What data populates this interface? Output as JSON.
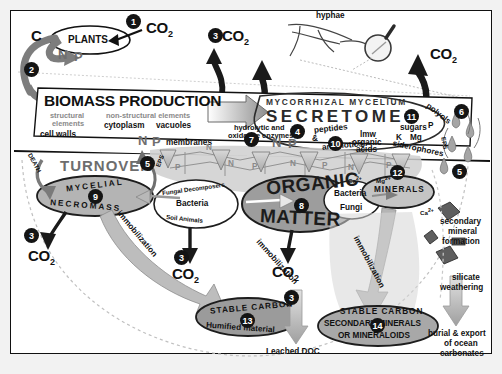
{
  "diagram": {
    "background_color": "#f2f2f2",
    "panel_color": "#ffffff"
  },
  "top": {
    "plants": "PLANTS",
    "c_label": "C",
    "n_label": "N",
    "p_label": "P",
    "co2_1": "CO",
    "co2_sub": "2",
    "hyphae": "hyphae"
  },
  "biomass": {
    "title": "BIOMASS PRODUCTION",
    "structural": "structural",
    "elements": "elements",
    "cell_walls": "cell walls",
    "non_structural": "non-structural elements",
    "cytoplasm": "cytoplasm",
    "vacuoles": "vacuoles",
    "membranes": "membranes",
    "n": "N",
    "p": "P"
  },
  "secretome": {
    "header": "MYCORRHIZAL MYCELIUM",
    "title": "SECRETOME",
    "enzymes_1": "hydrolytic and",
    "enzymes_2": "oxidative enzymes",
    "peptides": "peptides",
    "amp": "&",
    "antibiotics": "antibiotics",
    "lmw": "lmw",
    "organic": "organic",
    "acids": "acids",
    "sugars": "sugars",
    "polyols": "polyols",
    "siderophores": "siderophores",
    "p": "P",
    "k": "K",
    "mg": "Mg",
    "n": "N",
    "eps": "EPS"
  },
  "turnover": {
    "label": "TURNOVER",
    "death": "DEATH",
    "mycelial": "MYCELIAL",
    "necromass": "NECROMASS"
  },
  "decomposers": {
    "fungal": "Fungal Decomposers",
    "bacteria": "Bacteria",
    "soil_animals": "Soil Animals"
  },
  "organic_matter": {
    "line1": "ORGANIC",
    "line2": "MATTER"
  },
  "minerals_group": {
    "bacteria": "Bacteria",
    "fungi": "Fungi",
    "minerals": "MINERALS",
    "ca": "Ca",
    "mg": "Mg"
  },
  "stable_carbon_left": {
    "line1": "STABLE   CARBON",
    "line2": "Humified  material"
  },
  "stable_carbon_right": {
    "line1": "STABLE    CARBON",
    "line2": "SECONDARY        MINERALS",
    "line3": "OR      MINERALOIDS"
  },
  "weathering": {
    "ca": "Ca",
    "secondary": "secondary",
    "mineral": "mineral",
    "formation": "formation",
    "silicate": "silicate",
    "weathering": "weathering",
    "burial": "burial & export",
    "of_ocean": "of ocean",
    "carbonates": "carbonates"
  },
  "flows": {
    "immobilization": "immobilization",
    "leached_doc": "Leached DOC"
  },
  "co2_labels": [
    "CO",
    "CO",
    "CO",
    "CO",
    "CO"
  ],
  "badges": {
    "n1": "1",
    "n2": "2",
    "n3a": "3",
    "n3b": "3",
    "n3c": "3",
    "n3d": "3",
    "n4": "4",
    "n5a": "5",
    "n5b": "5",
    "n6": "6",
    "n7": "7",
    "n8": "8",
    "n9": "9",
    "n10": "10",
    "n11": "11",
    "n12": "12",
    "n13": "13",
    "n14": "14"
  }
}
